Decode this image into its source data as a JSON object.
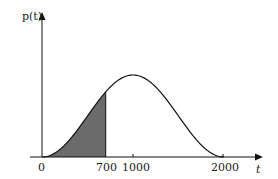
{
  "chart_data": {
    "type": "line",
    "title": "",
    "xlabel": "t",
    "ylabel": "p(t)",
    "x_ticks": [
      0,
      700,
      1000,
      2000
    ],
    "x_tick_labels": [
      "0",
      "700",
      "1000",
      "2000"
    ],
    "xlim": [
      0,
      2150
    ],
    "series": [
      {
        "name": "p(t)",
        "description": "bell-shaped density, zero at t=0 and t=2000, maximum at t=1000",
        "x": [
          0,
          200,
          400,
          600,
          700,
          800,
          1000,
          1200,
          1400,
          1600,
          1800,
          2000
        ],
        "values": [
          0,
          0.095,
          0.345,
          0.655,
          0.794,
          0.905,
          1.0,
          0.905,
          0.655,
          0.345,
          0.095,
          0
        ]
      }
    ],
    "shaded_region": {
      "from": 0,
      "to": 700,
      "color": "#6b6b6b"
    },
    "grid": false,
    "legend": null
  },
  "labels": {
    "y_axis": "p(t)",
    "x_axis": "t",
    "ticks": [
      "0",
      "700",
      "1000",
      "2000"
    ]
  }
}
